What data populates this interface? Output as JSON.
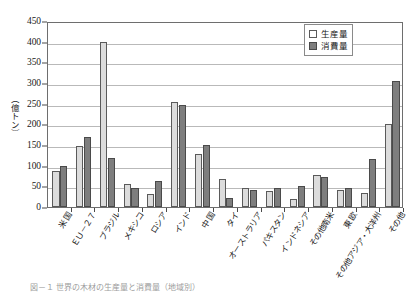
{
  "chart_data": {
    "type": "bar",
    "title": "",
    "xlabel": "",
    "ylabel": "（億トン）",
    "ylim": [
      0,
      450
    ],
    "ytick_step": 50,
    "yticks": [
      450,
      400,
      350,
      300,
      250,
      200,
      150,
      100,
      50,
      0
    ],
    "grid": true,
    "legend_position": "top-right",
    "categories": [
      "米 国",
      "ＥＵ－２７",
      "ブラジル",
      "メキシコ",
      "ロシア",
      "インド",
      "中 国",
      "タイ",
      "オーストラリア",
      "パキスタン",
      "インドネシア",
      "その他南米",
      "東 欧",
      "その他アジア・大洋州",
      "その他"
    ],
    "series": [
      {
        "name": "生産量",
        "color": "#dcdcdc",
        "values": [
          88,
          148,
          400,
          55,
          32,
          255,
          128,
          68,
          45,
          38,
          20,
          78,
          40,
          35,
          200
        ]
      },
      {
        "name": "消費量",
        "color": "#7e7e7e",
        "values": [
          100,
          170,
          118,
          47,
          62,
          248,
          150,
          22,
          40,
          45,
          50,
          72,
          45,
          115,
          305
        ]
      }
    ]
  },
  "legend": {
    "items": [
      {
        "label": "生産量"
      },
      {
        "label": "消費量"
      }
    ]
  },
  "caption": {
    "text": "図－１ 世界の木材の生産量と消費量（地域別）"
  },
  "colors": {
    "production_fill": "#dcdcdc",
    "consumption_fill": "#7e7e7e",
    "grid": "#b9b9b9",
    "axis": "#6e6e6e",
    "text": "#1a1a1a"
  }
}
